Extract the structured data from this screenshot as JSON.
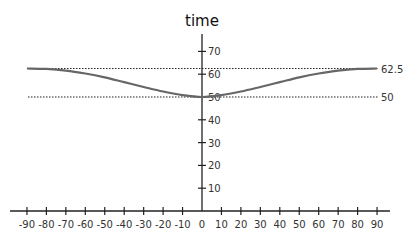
{
  "chart_data": {
    "type": "line",
    "title": "time",
    "xlabel": "",
    "ylabel": "time",
    "x_ticks": [
      -90,
      -80,
      -70,
      -60,
      -50,
      -40,
      -30,
      -20,
      -10,
      0,
      10,
      20,
      30,
      40,
      50,
      60,
      70,
      80,
      90
    ],
    "y_ticks": [
      10,
      20,
      30,
      40,
      50,
      60,
      70
    ],
    "xlim": [
      -98,
      98
    ],
    "ylim": [
      0,
      75
    ],
    "grid": false,
    "series": [
      {
        "name": "time",
        "color": "#666666",
        "x": [
          -90,
          -80,
          -70,
          -60,
          -50,
          -40,
          -30,
          -20,
          -10,
          0,
          10,
          20,
          30,
          40,
          50,
          60,
          70,
          80,
          90
        ],
        "values": [
          62.5,
          62.3,
          61.6,
          60.3,
          58.6,
          56.5,
          54.4,
          52.4,
          50.8,
          50,
          50.8,
          52.4,
          54.4,
          56.5,
          58.6,
          60.3,
          61.6,
          62.3,
          62.5
        ]
      }
    ],
    "reference_lines": [
      {
        "y": 62.5,
        "label": "62.5",
        "style": "dotted"
      },
      {
        "y": 50,
        "label": "50",
        "style": "dotted"
      }
    ]
  }
}
